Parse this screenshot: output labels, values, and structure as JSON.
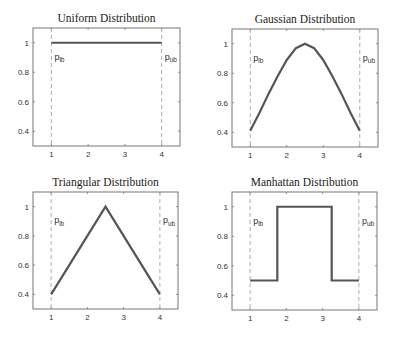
{
  "figure": {
    "width": 395,
    "height": 339,
    "line_color": "#555555",
    "frame_color": "#777777",
    "bound_line_color": "#999999"
  },
  "chart_data": [
    {
      "type": "line",
      "title": "Uniform Distribution",
      "xlabel": "",
      "ylabel": "",
      "xlim": [
        0.5,
        4.5
      ],
      "ylim": [
        0.3,
        1.1
      ],
      "xticks": [
        "1",
        "2",
        "3",
        "4"
      ],
      "yticks": [
        "0.4",
        "0.6",
        "0.8",
        "1"
      ],
      "grid": false,
      "series": [
        {
          "name": "uniform",
          "x": [
            1,
            4
          ],
          "y": [
            1,
            1
          ]
        }
      ],
      "annotations": [
        {
          "text": "p",
          "sub": "lb",
          "x": 1,
          "y": 0.9
        },
        {
          "text": "p",
          "sub": "ub",
          "x": 4,
          "y": 0.9
        }
      ],
      "vlines": [
        1,
        4
      ]
    },
    {
      "type": "line",
      "title": "Gaussian Distribution",
      "xlabel": "",
      "ylabel": "",
      "xlim": [
        0.5,
        4.5
      ],
      "ylim": [
        0.3,
        1.1
      ],
      "xticks": [
        "1",
        "2",
        "3",
        "4"
      ],
      "yticks": [
        "0.4",
        "0.6",
        "0.8",
        "1"
      ],
      "grid": false,
      "series": [
        {
          "name": "gaussian",
          "x": [
            1,
            1.25,
            1.5,
            1.75,
            2,
            2.25,
            2.5,
            2.75,
            3,
            3.25,
            3.5,
            3.75,
            4
          ],
          "y": [
            0.41,
            0.53,
            0.66,
            0.78,
            0.89,
            0.97,
            1.0,
            0.97,
            0.89,
            0.78,
            0.66,
            0.53,
            0.41
          ]
        }
      ],
      "annotations": [
        {
          "text": "p",
          "sub": "lb",
          "x": 1,
          "y": 0.9
        },
        {
          "text": "p",
          "sub": "ub",
          "x": 4,
          "y": 0.9
        }
      ],
      "vlines": [
        1,
        4
      ]
    },
    {
      "type": "line",
      "title": "Triangular Distribution",
      "xlabel": "",
      "ylabel": "",
      "xlim": [
        0.5,
        4.5
      ],
      "ylim": [
        0.3,
        1.1
      ],
      "xticks": [
        "1",
        "2",
        "3",
        "4"
      ],
      "yticks": [
        "0.4",
        "0.6",
        "0.8",
        "1"
      ],
      "grid": false,
      "series": [
        {
          "name": "triangular",
          "x": [
            1,
            2.5,
            4
          ],
          "y": [
            0.4,
            1.0,
            0.4
          ]
        }
      ],
      "annotations": [
        {
          "text": "p",
          "sub": "lb",
          "x": 1,
          "y": 0.9
        },
        {
          "text": "p",
          "sub": "ub",
          "x": 4,
          "y": 0.9
        }
      ],
      "vlines": [
        1,
        4
      ]
    },
    {
      "type": "line",
      "title": "Manhattan Distribution",
      "xlabel": "",
      "ylabel": "",
      "xlim": [
        0.5,
        4.5
      ],
      "ylim": [
        0.3,
        1.1
      ],
      "xticks": [
        "1",
        "2",
        "3",
        "4"
      ],
      "yticks": [
        "0.4",
        "0.6",
        "0.8",
        "1"
      ],
      "grid": false,
      "series": [
        {
          "name": "manhattan",
          "x": [
            1,
            1.75,
            1.75,
            3.25,
            3.25,
            4
          ],
          "y": [
            0.5,
            0.5,
            1.0,
            1.0,
            0.5,
            0.5
          ]
        }
      ],
      "annotations": [
        {
          "text": "p",
          "sub": "lb",
          "x": 1,
          "y": 0.9
        },
        {
          "text": "p",
          "sub": "ub",
          "x": 4,
          "y": 0.9
        }
      ],
      "vlines": [
        1,
        4
      ]
    }
  ],
  "panels": [
    {
      "left": 33,
      "top": 28,
      "right": 180,
      "bottom": 146
    },
    {
      "left": 232,
      "top": 29,
      "right": 378,
      "bottom": 147
    },
    {
      "left": 33,
      "top": 192,
      "right": 178,
      "bottom": 309
    },
    {
      "left": 232,
      "top": 192,
      "right": 377,
      "bottom": 310
    }
  ]
}
